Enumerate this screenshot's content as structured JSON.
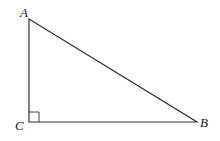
{
  "diagram": {
    "type": "right-triangle",
    "vertices": {
      "A": {
        "label": "A",
        "x": 29,
        "y": 19
      },
      "B": {
        "label": "B",
        "x": 197,
        "y": 122
      },
      "C": {
        "label": "C",
        "x": 29,
        "y": 122
      }
    },
    "right_angle_at": "C",
    "stroke_color": "#333333"
  }
}
